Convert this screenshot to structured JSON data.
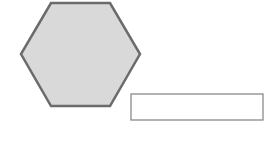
{
  "diagram": {
    "shapes": [
      {
        "type": "hexagon",
        "fill": "#d9d9d9",
        "stroke": "#6b6b6b",
        "points": "51,3 110,3 140,54 110,106 51,106 21,54"
      },
      {
        "type": "rectangle",
        "fill": "#ffffff",
        "stroke": "#8a8a8a",
        "x": 131,
        "y": 94,
        "width": 132,
        "height": 26
      }
    ]
  }
}
